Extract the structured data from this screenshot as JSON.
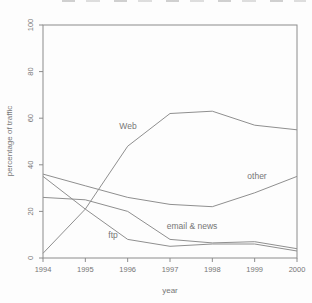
{
  "figure": {
    "cropped_top_text_present": true
  },
  "chart_data": {
    "type": "line",
    "title": "",
    "xlabel": "year",
    "ylabel": "percentage of traffic",
    "x": [
      1994,
      1995,
      1996,
      1997,
      1998,
      1999,
      2000
    ],
    "xticks": [
      1994,
      1995,
      1996,
      1997,
      1998,
      1999,
      2000
    ],
    "yticks": [
      0,
      20,
      40,
      60,
      80,
      100
    ],
    "xlim": [
      1994,
      2000
    ],
    "ylim": [
      0,
      100
    ],
    "grid": false,
    "legend": "inline-labels",
    "series": [
      {
        "name": "Web",
        "values": [
          2,
          21,
          48,
          62,
          63,
          57,
          55
        ]
      },
      {
        "name": "other",
        "values": [
          36,
          31,
          26,
          23,
          22,
          28,
          35
        ]
      },
      {
        "name": "email & news",
        "values": [
          26,
          25,
          20,
          8,
          6.5,
          7,
          4
        ]
      },
      {
        "name": "ftp",
        "values": [
          35,
          21,
          8,
          5,
          6,
          6,
          3
        ]
      }
    ],
    "annotations": [
      {
        "text": "Web",
        "series": "Web",
        "x_px": 128,
        "y_px": 129
      },
      {
        "text": "other",
        "series": "other",
        "x_px": 257,
        "y_px": 179
      },
      {
        "text": "email & news",
        "series": "email & news",
        "x_px": 192,
        "y_px": 229
      },
      {
        "text": "ftp",
        "series": "ftp",
        "x_px": 113,
        "y_px": 238
      }
    ],
    "colors": {
      "line": "#8f8f8f",
      "axis": "#8c8c8c",
      "text": "#767676",
      "background": "#fdfdfd"
    }
  }
}
